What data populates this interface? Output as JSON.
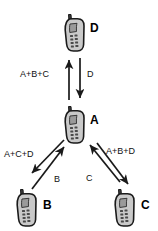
{
  "diagram": {
    "background_color": "#ffffff",
    "line_color": "#1a1a1a",
    "nodes": [
      {
        "id": "D",
        "label": "D",
        "icon": "mobile-phone-icon",
        "x": 62,
        "y": 13,
        "label_x": 90,
        "label_y": 22
      },
      {
        "id": "A",
        "label": "A",
        "icon": "mobile-phone-icon",
        "x": 62,
        "y": 105,
        "label_x": 90,
        "label_y": 114
      },
      {
        "id": "B",
        "label": "B",
        "icon": "mobile-phone-icon",
        "x": 14,
        "y": 188,
        "label_x": 43,
        "label_y": 199
      },
      {
        "id": "C",
        "label": "C",
        "icon": "mobile-phone-icon",
        "x": 112,
        "y": 188,
        "label_x": 141,
        "label_y": 199
      }
    ],
    "edges": [
      {
        "id": "a-to-d",
        "from": "A",
        "to": "D",
        "label": "A+B+C",
        "direction": "up",
        "label_x": 20,
        "label_y": 70
      },
      {
        "id": "d-to-a",
        "from": "D",
        "to": "A",
        "label": "D",
        "direction": "down",
        "label_x": 87,
        "label_y": 70
      },
      {
        "id": "a-to-b",
        "from": "A",
        "to": "B",
        "label": "A+C+D",
        "direction": "down-left",
        "label_x": 4,
        "label_y": 150
      },
      {
        "id": "b-to-a",
        "from": "B",
        "to": "A",
        "label": "B",
        "direction": "up-right",
        "label_x": 54,
        "label_y": 175
      },
      {
        "id": "a-to-c",
        "from": "A",
        "to": "C",
        "label": "A+B+D",
        "direction": "down-right",
        "label_x": 106,
        "label_y": 147
      },
      {
        "id": "c-to-a",
        "from": "C",
        "to": "A",
        "label": "C",
        "direction": "up-left",
        "label_x": 86,
        "label_y": 174
      }
    ]
  }
}
